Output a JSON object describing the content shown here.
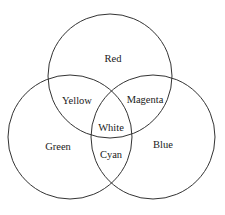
{
  "diagram": {
    "type": "venn",
    "circles": [
      {
        "name": "Red",
        "cx": 110,
        "cy": 76,
        "r": 62
      },
      {
        "name": "Green",
        "cx": 70,
        "cy": 137,
        "r": 62
      },
      {
        "name": "Blue",
        "cx": 153,
        "cy": 137,
        "r": 62
      }
    ],
    "labels": {
      "red": "Red",
      "green": "Green",
      "blue": "Blue",
      "yellow": "Yellow",
      "magenta": "Magenta",
      "cyan": "Cyan",
      "white": "White"
    },
    "stroke_color": "#333333"
  }
}
